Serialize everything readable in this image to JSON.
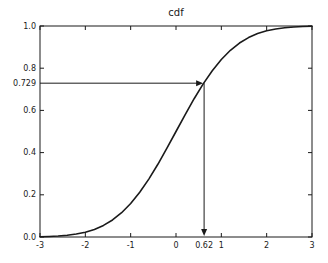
{
  "figure": {
    "background": "#ffffff",
    "line_color": "#1a1a1a"
  },
  "chart_data": {
    "type": "line",
    "title": "cdf",
    "xlabel": "",
    "ylabel": "",
    "xlim": [
      -3,
      3
    ],
    "ylim": [
      0.0,
      1.0
    ],
    "grid": false,
    "legend": false,
    "x_tick_values": [
      -3,
      -2,
      -1,
      0,
      1,
      2,
      3
    ],
    "x_tick_labels": [
      "-3",
      "-2",
      "-1",
      "0",
      "1",
      "2",
      "3"
    ],
    "y_tick_values": [
      0.0,
      0.2,
      0.4,
      0.6,
      0.8,
      1.0
    ],
    "y_tick_labels": [
      "0.0",
      "0.2",
      "0.4",
      "0.6",
      "0.8",
      "1.0"
    ],
    "series": [
      {
        "name": "normal-cdf",
        "x": [
          -3.0,
          -2.8,
          -2.6,
          -2.4,
          -2.2,
          -2.0,
          -1.8,
          -1.6,
          -1.4,
          -1.2,
          -1.0,
          -0.8,
          -0.6,
          -0.4,
          -0.2,
          0.0,
          0.2,
          0.4,
          0.6,
          0.8,
          1.0,
          1.2,
          1.4,
          1.6,
          1.8,
          2.0,
          2.2,
          2.4,
          2.6,
          2.8,
          3.0
        ],
        "y": [
          0.0013,
          0.0026,
          0.0047,
          0.0082,
          0.0139,
          0.0228,
          0.0359,
          0.0548,
          0.0808,
          0.1151,
          0.1587,
          0.2119,
          0.2743,
          0.3446,
          0.4207,
          0.5,
          0.5793,
          0.6554,
          0.7257,
          0.7881,
          0.8413,
          0.8849,
          0.9192,
          0.9452,
          0.9641,
          0.9772,
          0.9861,
          0.9918,
          0.9953,
          0.9974,
          0.9987
        ]
      }
    ],
    "annotations": [
      {
        "kind": "horizontal-arrow",
        "label": "0.729",
        "y": 0.729,
        "x_from": -3,
        "x_to": 0.62
      },
      {
        "kind": "vertical-arrow",
        "label": "0.62",
        "x": 0.62,
        "y_from": 0.729,
        "y_to": 0.0
      }
    ]
  }
}
